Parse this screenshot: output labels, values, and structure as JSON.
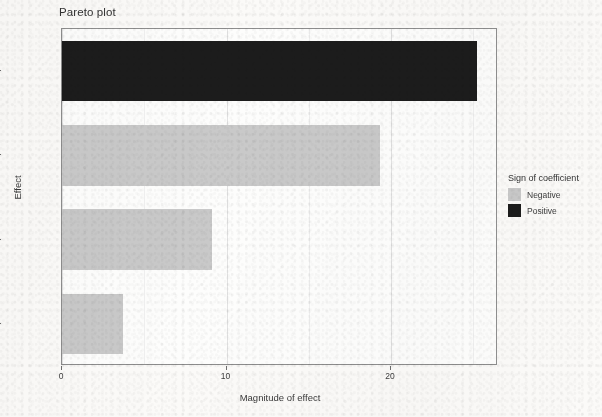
{
  "chart_data": {
    "type": "bar",
    "orientation": "horizontal",
    "title": "Pareto plot",
    "xlabel": "Magnitude of effect",
    "ylabel": "Effect",
    "categories": [
      "u6LL5",
      "u5OIN",
      "u7Porteur",
      "u7None"
    ],
    "values": [
      25.2,
      19.3,
      9.1,
      3.7
    ],
    "series": [
      {
        "name": "Magnitude of effect",
        "values": [
          25.2,
          19.3,
          9.1,
          3.7
        ],
        "signs": [
          "Positive",
          "Negative",
          "Negative",
          "Negative"
        ]
      }
    ],
    "xlim": [
      0,
      26.5
    ],
    "xticks": [
      0,
      10,
      20
    ],
    "xtick_labels": [
      "0",
      "10",
      "20"
    ],
    "grid": true,
    "legend": {
      "title": "Sign of coefficient",
      "position": "right",
      "entries": [
        {
          "label": "Negative",
          "color": "#c9c9c9"
        },
        {
          "label": "Positive",
          "color": "#1c1c1c"
        }
      ]
    },
    "colors": {
      "negative": "#c9c9c9",
      "positive": "#1c1c1c",
      "panel": "#fdfdfc",
      "grid": "#e2e2e2"
    }
  }
}
